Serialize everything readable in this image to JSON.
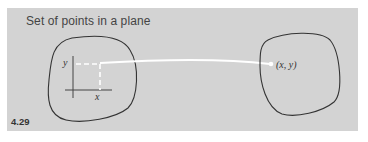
{
  "title": "Set of points in a plane",
  "figure_number": "4.29",
  "labels": {
    "y_axis": "y",
    "x_axis": "x",
    "point": "(x, y)"
  },
  "colors": {
    "panel_background": "#d3d3d3",
    "outline": "#333333",
    "mapping_line": "#ffffff",
    "text": "#444444"
  }
}
